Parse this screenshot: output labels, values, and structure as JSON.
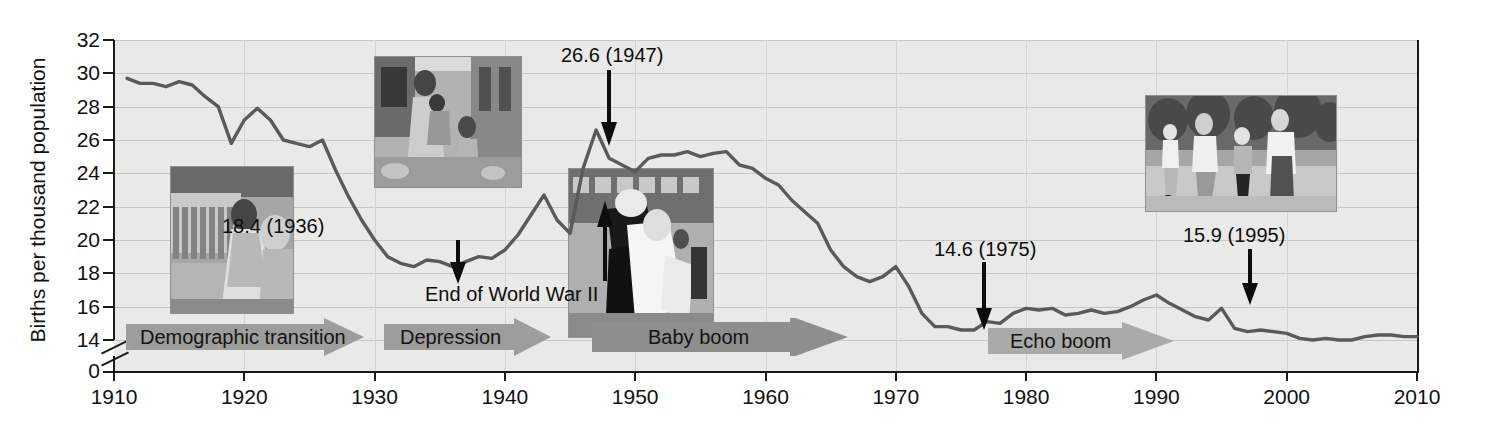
{
  "chart_data": {
    "type": "line",
    "title": "",
    "xlabel": "",
    "ylabel": "Births per thousand population",
    "xlim": [
      1910,
      2010
    ],
    "ylim": [
      14,
      32
    ],
    "y_axis_break": true,
    "y_zero_tick": "0",
    "grid": true,
    "legend": "none",
    "line_color": "#5a5a58",
    "plot_background": "#e9e9e7",
    "xticks": [
      1910,
      1920,
      1930,
      1940,
      1950,
      1960,
      1970,
      1980,
      1990,
      2000,
      2010
    ],
    "yticks": [
      14,
      16,
      18,
      20,
      22,
      24,
      26,
      28,
      30,
      32
    ],
    "x": [
      1911,
      1912,
      1913,
      1914,
      1915,
      1916,
      1917,
      1918,
      1919,
      1920,
      1921,
      1922,
      1923,
      1924,
      1925,
      1926,
      1927,
      1928,
      1929,
      1930,
      1931,
      1932,
      1933,
      1934,
      1935,
      1936,
      1937,
      1938,
      1939,
      1940,
      1941,
      1942,
      1943,
      1944,
      1945,
      1946,
      1947,
      1948,
      1949,
      1950,
      1951,
      1952,
      1953,
      1954,
      1955,
      1956,
      1957,
      1958,
      1959,
      1960,
      1961,
      1962,
      1963,
      1964,
      1965,
      1966,
      1967,
      1968,
      1969,
      1970,
      1971,
      1972,
      1973,
      1974,
      1975,
      1976,
      1977,
      1978,
      1979,
      1980,
      1981,
      1982,
      1983,
      1984,
      1985,
      1986,
      1987,
      1988,
      1989,
      1990,
      1991,
      1992,
      1993,
      1994,
      1995,
      1996,
      1997,
      1998,
      1999,
      2000,
      2001,
      2002,
      2003,
      2004,
      2005,
      2006,
      2007,
      2008,
      2009,
      2010
    ],
    "y": [
      29.7,
      29.4,
      29.4,
      29.2,
      29.5,
      29.3,
      28.6,
      28.0,
      25.8,
      27.2,
      27.9,
      27.2,
      26.0,
      25.8,
      25.6,
      26.0,
      24.2,
      22.6,
      21.2,
      20.0,
      19.0,
      18.6,
      18.4,
      18.8,
      18.7,
      18.4,
      18.7,
      19.0,
      18.9,
      19.4,
      20.3,
      21.5,
      22.7,
      21.2,
      20.4,
      24.3,
      26.6,
      24.9,
      24.5,
      24.1,
      24.9,
      25.1,
      25.1,
      25.3,
      25.0,
      25.2,
      25.3,
      24.5,
      24.3,
      23.7,
      23.3,
      22.4,
      21.7,
      21.0,
      19.4,
      18.4,
      17.8,
      17.5,
      17.8,
      18.4,
      17.2,
      15.6,
      14.8,
      14.8,
      14.6,
      14.6,
      15.1,
      15.0,
      15.6,
      15.9,
      15.8,
      15.9,
      15.5,
      15.6,
      15.8,
      15.6,
      15.7,
      16.0,
      16.4,
      16.7,
      16.2,
      15.8,
      15.4,
      15.2,
      15.9,
      14.7,
      14.5,
      14.6,
      14.5,
      14.4,
      14.1,
      14.0,
      14.1,
      14.0,
      14.0,
      14.2,
      14.3,
      14.3,
      14.2,
      14.2
    ]
  },
  "annotations": [
    {
      "id": "peak-1947",
      "label": "26.6 (1947)",
      "value": 26.6,
      "year": 1947,
      "arrow": "down"
    },
    {
      "id": "trough-1936",
      "label": "18.4 (1936)",
      "value": 18.4,
      "year": 1936,
      "arrow": "down"
    },
    {
      "id": "ww2-end",
      "label": "End of World War II",
      "value": 20.4,
      "year": 1945,
      "arrow": "up"
    },
    {
      "id": "trough-1975",
      "label": "14.6 (1975)",
      "value": 14.6,
      "year": 1975,
      "arrow": "down"
    },
    {
      "id": "peak-1995",
      "label": "15.9 (1995)",
      "value": 15.9,
      "year": 1995,
      "arrow": "down"
    }
  ],
  "banners": [
    {
      "id": "demographic-transition",
      "label": "Demographic transition"
    },
    {
      "id": "depression",
      "label": "Depression"
    },
    {
      "id": "baby-boom",
      "label": "Baby boom"
    },
    {
      "id": "echo-boom",
      "label": "Echo boom"
    }
  ],
  "photos": [
    {
      "id": "textile-mill-worker",
      "caption": "textile-mill-worker-photo"
    },
    {
      "id": "depression-family",
      "caption": "depression-family-photo"
    },
    {
      "id": "vj-day-kiss",
      "caption": "vj-day-kiss-photo"
    },
    {
      "id": "family-walking",
      "caption": "family-walking-photo"
    }
  ],
  "ticks": {
    "y": [
      "32",
      "30",
      "28",
      "26",
      "24",
      "22",
      "20",
      "18",
      "16",
      "14",
      "0"
    ],
    "x": [
      "1910",
      "1920",
      "1930",
      "1940",
      "1950",
      "1960",
      "1970",
      "1980",
      "1990",
      "2000",
      "2010"
    ]
  }
}
